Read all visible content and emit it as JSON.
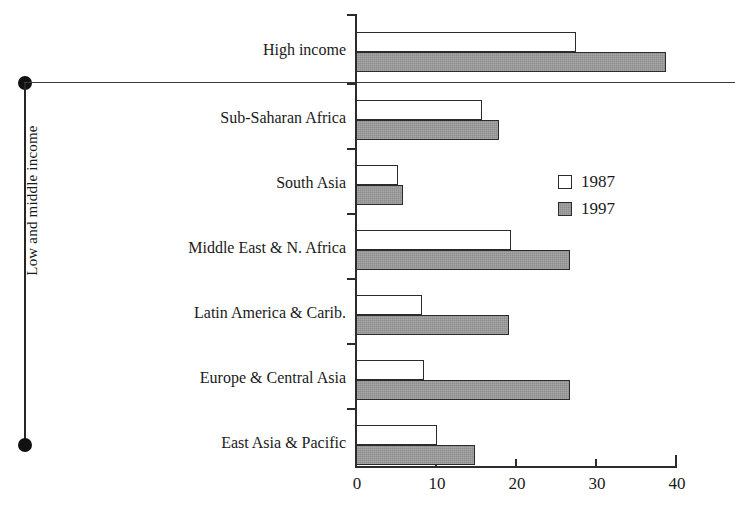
{
  "chart_data": {
    "type": "bar",
    "orientation": "horizontal",
    "title": "",
    "xlabel": "",
    "ylabel": "",
    "xlim": [
      0,
      40
    ],
    "xticks": [
      0,
      10,
      20,
      30,
      40
    ],
    "xtick_labels": [
      "0",
      "10",
      "20",
      "30",
      "40"
    ],
    "grid": false,
    "legend_position": "center-right",
    "categories": [
      "High income",
      "Sub-Saharan Africa",
      "South Asia",
      "Middle East & N. Africa",
      "Latin America & Carib.",
      "Europe & Central Asia",
      "East Asia & Pacific"
    ],
    "series": [
      {
        "name": "1987",
        "color": "#ffffff",
        "values": [
          27.5,
          15.8,
          5.2,
          19.4,
          8.3,
          8.5,
          10.1
        ]
      },
      {
        "name": "1997",
        "color": "#8e8e8e",
        "values": [
          38.8,
          17.9,
          5.9,
          26.8,
          19.1,
          26.8,
          14.9
        ]
      }
    ],
    "group_bracket_label": "Low and middle income",
    "group_bracket_categories": [
      "Sub-Saharan Africa",
      "South Asia",
      "Middle East & N. Africa",
      "Latin America & Carib.",
      "Europe & Central Asia",
      "East Asia & Pacific"
    ]
  },
  "legend": {
    "entries": [
      {
        "label": "1987",
        "swatch": "open-square-swatch"
      },
      {
        "label": "1997",
        "swatch": "filled-gray-square-swatch"
      }
    ]
  },
  "axis": {
    "x_tick_labels": [
      "0",
      "10",
      "20",
      "30",
      "40"
    ]
  },
  "labels": {
    "group": "Low and middle income",
    "categories": [
      "High income",
      "Sub-Saharan Africa",
      "South Asia",
      "Middle East & N. Africa",
      "Latin America & Carib.",
      "Europe & Central Asia",
      "East Asia & Pacific"
    ]
  },
  "colors": {
    "series_1987": "#ffffff",
    "series_1997": "#8e8e8e",
    "ink": "#2b2b2b",
    "background": "#ffffff"
  }
}
